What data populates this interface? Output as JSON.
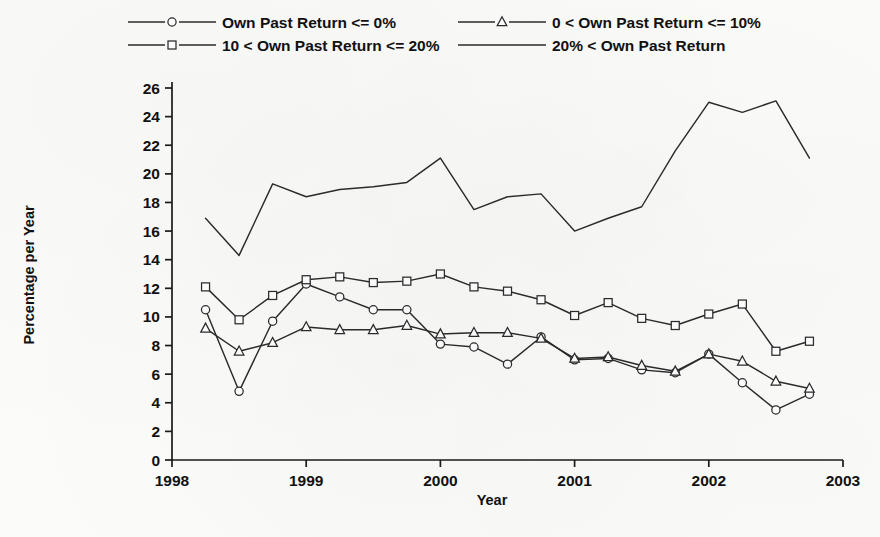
{
  "chart_data": {
    "type": "line",
    "title": "",
    "xlabel": "Year",
    "ylabel": "Percentage per Year",
    "xlim": [
      1998.0,
      2003.0
    ],
    "ylim": [
      0,
      26
    ],
    "x_ticks": [
      1998,
      1999,
      2000,
      2001,
      2002,
      2003
    ],
    "x_tick_labels": [
      "1998",
      "1999",
      "2000",
      "2001",
      "2002",
      "2003"
    ],
    "y_ticks": [
      0,
      2,
      4,
      6,
      8,
      10,
      12,
      14,
      16,
      18,
      20,
      22,
      24,
      26
    ],
    "y_tick_labels": [
      "0",
      "2",
      "4",
      "6",
      "8",
      "10",
      "12",
      "14",
      "16",
      "18",
      "20",
      "22",
      "24",
      "26"
    ],
    "grid": false,
    "legend_position": "top",
    "x": [
      1998.25,
      1998.5,
      1998.75,
      1999.0,
      1999.25,
      1999.5,
      1999.75,
      2000.0,
      2000.25,
      2000.5,
      2000.75,
      2001.0,
      2001.25,
      2001.5,
      2001.75,
      2002.0,
      2002.25,
      2002.5,
      2002.75
    ],
    "series": [
      {
        "name": "Own Past Return <= 0%",
        "marker": "circle",
        "values": [
          10.5,
          4.8,
          9.7,
          12.3,
          11.4,
          10.5,
          10.5,
          8.1,
          7.9,
          6.7,
          8.6,
          7.0,
          7.1,
          6.3,
          6.1,
          7.4,
          5.4,
          3.5,
          4.6
        ]
      },
      {
        "name": "0 < Own Past Return <= 10%",
        "marker": "triangle",
        "values": [
          9.2,
          7.6,
          8.2,
          9.3,
          9.1,
          9.1,
          9.4,
          8.8,
          8.9,
          8.9,
          8.5,
          7.1,
          7.2,
          6.6,
          6.2,
          7.4,
          6.9,
          5.5,
          5.0
        ]
      },
      {
        "name": "10 < Own Past Return <= 20%",
        "marker": "square",
        "values": [
          12.1,
          9.8,
          11.5,
          12.6,
          12.8,
          12.4,
          12.5,
          13.0,
          12.1,
          11.8,
          11.2,
          10.1,
          11.0,
          9.9,
          9.4,
          10.2,
          10.9,
          7.6,
          8.3
        ]
      },
      {
        "name": "20% < Own Past Return",
        "marker": "none",
        "values": [
          16.9,
          14.3,
          19.3,
          18.4,
          18.9,
          19.1,
          19.4,
          21.1,
          17.5,
          18.4,
          18.6,
          16.0,
          16.9,
          17.7,
          21.6,
          25.0,
          24.3,
          25.1,
          21.1
        ]
      }
    ]
  },
  "legend": {
    "entries": [
      {
        "label": "Own Past Return <= 0%",
        "marker": "circle"
      },
      {
        "label": "0 < Own Past Return <= 10%",
        "marker": "triangle"
      },
      {
        "label": "10 < Own Past Return <= 20%",
        "marker": "square"
      },
      {
        "label": "20% < Own Past Return",
        "marker": "none"
      }
    ]
  }
}
